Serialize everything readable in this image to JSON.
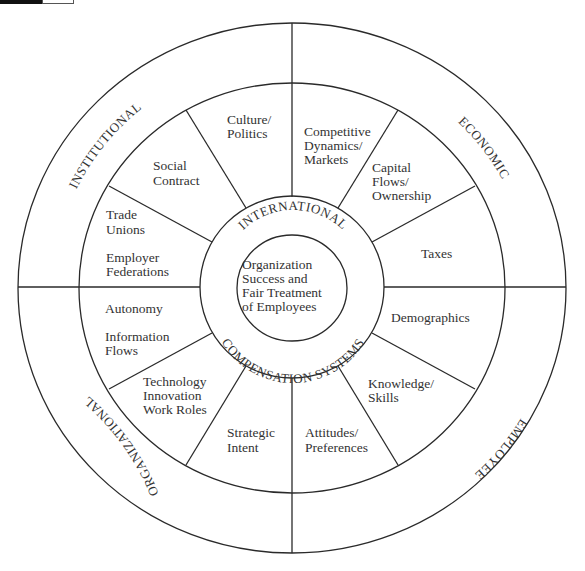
{
  "diagram": {
    "center": {
      "lines": [
        "Organization",
        "Success and",
        "Fair Treatment",
        "of Employees"
      ]
    },
    "ring": {
      "top_text": "INTERNATIONAL",
      "bottom_text": "COMPENSATION SYSTEMS"
    },
    "quadrants": [
      {
        "name": "INSTITUTIONAL"
      },
      {
        "name": "ECONOMIC"
      },
      {
        "name": "EMPLOYEE"
      },
      {
        "name": "ORGANIZATIONAL"
      }
    ],
    "segments": {
      "culture_politics": [
        "Culture/",
        "Politics"
      ],
      "social_contract": [
        "Social",
        "Contract"
      ],
      "trade_unions": [
        "Trade",
        "Unions",
        "Employer",
        "Federations"
      ],
      "competitive": [
        "Competitive",
        "Dynamics/",
        "Markets"
      ],
      "capital": [
        "Capital",
        "Flows/",
        "Ownership"
      ],
      "taxes": [
        "Taxes"
      ],
      "demographics": [
        "Demographics"
      ],
      "knowledge": [
        "Knowledge/",
        "Skills"
      ],
      "attitudes": [
        "Attitudes/",
        "Preferences"
      ],
      "autonomy": [
        "Autonomy",
        "Information",
        "Flows"
      ],
      "technology": [
        "Technology",
        "Innovation",
        "Work Roles"
      ],
      "strategic": [
        "Strategic",
        "Intent"
      ]
    },
    "colors": {
      "line": "#2a2a2a",
      "text": "#333333",
      "background": "#ffffff"
    }
  }
}
